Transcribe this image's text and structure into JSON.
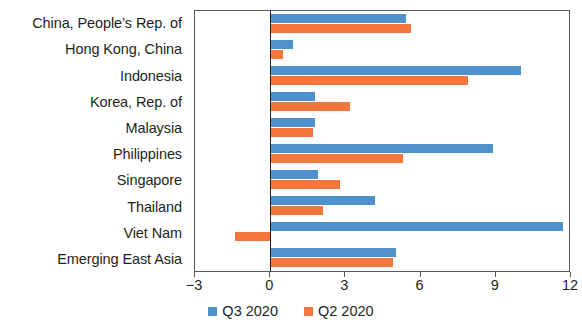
{
  "chart_data": {
    "type": "bar",
    "title": "",
    "subtitle": "",
    "xlabel": "",
    "ylabel": "",
    "orientation": "horizontal",
    "grid": false,
    "legend_position": "bottom-center",
    "xlim": [
      -3,
      12
    ],
    "xticks": [
      -3,
      0,
      3,
      6,
      9,
      12
    ],
    "xticklabels": [
      "−3",
      "0",
      "3",
      "6",
      "9",
      "12"
    ],
    "categories": [
      "China, People’s Rep. of",
      "Hong Kong, China",
      "Indonesia",
      "Korea, Rep. of",
      "Malaysia",
      "Philippines",
      "Singapore",
      "Thailand",
      "Viet Nam",
      "Emerging East Asia"
    ],
    "series": [
      {
        "name": "Q3 2020",
        "color": "#4f91cd",
        "values": [
          5.4,
          0.9,
          10.0,
          1.8,
          1.8,
          8.9,
          1.9,
          4.2,
          11.7,
          5.0
        ]
      },
      {
        "name": "Q2 2020",
        "color": "#f4763b",
        "values": [
          5.6,
          0.5,
          7.9,
          3.2,
          1.7,
          5.3,
          2.8,
          2.1,
          -1.4,
          4.9
        ]
      }
    ]
  },
  "legend": {
    "items": [
      {
        "label": "Q3 2020",
        "color": "#4f91cd"
      },
      {
        "label": "Q2 2020",
        "color": "#f4763b"
      }
    ]
  }
}
